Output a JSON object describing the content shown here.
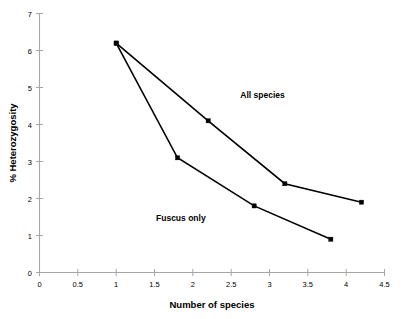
{
  "chart_data": {
    "type": "line",
    "title": "",
    "xlabel": "Number of species",
    "ylabel": "% Heterozygosity",
    "xlim": [
      0,
      4.5
    ],
    "ylim": [
      0,
      7
    ],
    "grid": false,
    "legend_position": "inline-annotations",
    "xticks": [
      "0",
      "0.5",
      "1",
      "1.5",
      "2",
      "2.5",
      "3",
      "3.5",
      "4",
      "4.5"
    ],
    "xtick_values": [
      0,
      0.5,
      1,
      1.5,
      2,
      2.5,
      3,
      3.5,
      4,
      4.5
    ],
    "yticks": [
      "0",
      "1",
      "2",
      "3",
      "4",
      "5",
      "6",
      "7"
    ],
    "ytick_values": [
      0,
      1,
      2,
      3,
      4,
      5,
      6,
      7
    ],
    "series": [
      {
        "name": "All species",
        "x": [
          1,
          2.2,
          3.2,
          4.2
        ],
        "values": [
          6.2,
          4.1,
          2.4,
          1.9
        ],
        "color": "#000000",
        "marker": "square",
        "label_x": 2.62,
        "label_y": 4.72
      },
      {
        "name": "Fuscus only",
        "x": [
          1,
          1.8,
          2.8,
          3.8
        ],
        "values": [
          6.2,
          3.1,
          1.8,
          0.9
        ],
        "color": "#000000",
        "marker": "square",
        "label_x": 1.52,
        "label_y": 1.38
      }
    ]
  },
  "figure": {
    "background_color": "#ffffff",
    "axis_color": "#a6a6a6",
    "line_color": "#000000"
  }
}
